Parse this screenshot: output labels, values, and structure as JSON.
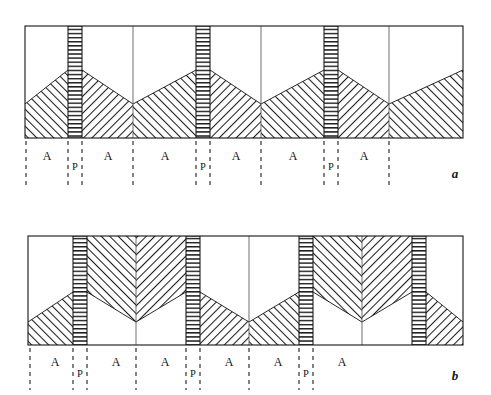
{
  "figure": {
    "type": "schematic-diagram",
    "title": "",
    "background_color": "#ffffff",
    "line_color": "#141414",
    "hatch_color": "#1e1e1e",
    "frame_stroke_width": 1.1
  },
  "panels": [
    {
      "id": "a",
      "letter": "a",
      "letter_position": {
        "x": 455,
        "y": 176
      },
      "frame": {
        "x": 25,
        "y": 26,
        "width": 438,
        "height": 112
      },
      "p_bands": [
        {
          "x": 68,
          "width": 14,
          "label": "P"
        },
        {
          "x": 196,
          "width": 14,
          "label": "P"
        },
        {
          "x": 324,
          "width": 14,
          "label": "P"
        }
      ],
      "interior_vertical_lines": [
        133,
        261,
        389
      ],
      "apex_y": 70,
      "valley_y": 104,
      "labels": [
        {
          "text": "A",
          "x": 47,
          "y": 158
        },
        {
          "text": "P",
          "x": 75,
          "y": 168
        },
        {
          "text": "A",
          "x": 108,
          "y": 158
        },
        {
          "text": "A",
          "x": 165,
          "y": 158
        },
        {
          "text": "P",
          "x": 203,
          "y": 168
        },
        {
          "text": "A",
          "x": 236,
          "y": 158
        },
        {
          "text": "A",
          "x": 293,
          "y": 158
        },
        {
          "text": "P",
          "x": 331,
          "y": 168
        },
        {
          "text": "A",
          "x": 364,
          "y": 158
        }
      ],
      "dashed_lines": [
        {
          "x": 26,
          "y1": 140,
          "y2": 188
        },
        {
          "x": 68,
          "y1": 140,
          "y2": 188
        },
        {
          "x": 82,
          "y1": 140,
          "y2": 188
        },
        {
          "x": 133,
          "y1": 140,
          "y2": 188
        },
        {
          "x": 196,
          "y1": 140,
          "y2": 188
        },
        {
          "x": 210,
          "y1": 140,
          "y2": 188
        },
        {
          "x": 261,
          "y1": 140,
          "y2": 188
        },
        {
          "x": 324,
          "y1": 140,
          "y2": 188
        },
        {
          "x": 338,
          "y1": 140,
          "y2": 188
        },
        {
          "x": 389,
          "y1": 140,
          "y2": 188
        }
      ]
    },
    {
      "id": "b",
      "letter": "b",
      "letter_position": {
        "x": 455,
        "y": 378
      },
      "frame": {
        "x": 28,
        "y": 236,
        "width": 435,
        "height": 109
      },
      "p_bands": [
        {
          "x": 73,
          "width": 14,
          "label": "P"
        },
        {
          "x": 186,
          "width": 14,
          "label": "P"
        },
        {
          "x": 299,
          "width": 14,
          "label": "P"
        },
        {
          "x": 412,
          "width": 14,
          "label": "P"
        }
      ],
      "interior_vertical_lines": [
        136,
        249,
        362
      ],
      "apex_y": 292,
      "valley_y": 322,
      "labels": [
        {
          "text": "A",
          "x": 55,
          "y": 362
        },
        {
          "text": "P",
          "x": 80,
          "y": 373
        },
        {
          "text": "A",
          "x": 116,
          "y": 362
        },
        {
          "text": "A",
          "x": 165,
          "y": 362
        },
        {
          "text": "P",
          "x": 193,
          "y": 373
        },
        {
          "text": "A",
          "x": 229,
          "y": 362
        },
        {
          "text": "A",
          "x": 278,
          "y": 362
        },
        {
          "text": "P",
          "x": 306,
          "y": 373
        },
        {
          "text": "A",
          "x": 342,
          "y": 362
        }
      ],
      "dashed_lines": [
        {
          "x": 30,
          "y1": 347,
          "y2": 390
        },
        {
          "x": 73,
          "y1": 347,
          "y2": 390
        },
        {
          "x": 87,
          "y1": 347,
          "y2": 390
        },
        {
          "x": 136,
          "y1": 347,
          "y2": 390
        },
        {
          "x": 186,
          "y1": 347,
          "y2": 390
        },
        {
          "x": 200,
          "y1": 347,
          "y2": 390
        },
        {
          "x": 249,
          "y1": 347,
          "y2": 390
        },
        {
          "x": 299,
          "y1": 347,
          "y2": 390
        },
        {
          "x": 313,
          "y1": 347,
          "y2": 390
        }
      ]
    }
  ],
  "legend_keys": {
    "A": "A",
    "P": "P"
  }
}
